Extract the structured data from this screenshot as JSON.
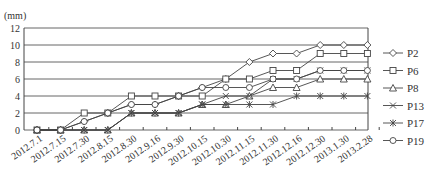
{
  "chart_data": {
    "type": "line",
    "title": "",
    "unit_label": "(mm)",
    "xlabel": "",
    "ylabel": "(mm)",
    "ylim": [
      0,
      12
    ],
    "yticks": [
      0,
      2,
      4,
      6,
      8,
      10,
      12
    ],
    "grid": true,
    "legend_position": "right",
    "categories": [
      "2012.7.1",
      "2012.7.15",
      "2012.7.30",
      "2012.8.15",
      "2012.8.30",
      "2012.9.16",
      "2012.9.30",
      "2012.10.15",
      "2012.10.30",
      "2012.11.15",
      "2012.11.30",
      "2012.12.16",
      "2012.12.30",
      "2013.1.30",
      "2013.2.28"
    ],
    "series": [
      {
        "name": "P2",
        "marker": "diamond",
        "values": [
          0,
          0,
          1,
          2,
          3,
          3,
          4,
          5,
          6,
          8,
          9,
          9,
          10,
          10,
          10
        ]
      },
      {
        "name": "P6",
        "marker": "square",
        "values": [
          0,
          0,
          2,
          2,
          4,
          4,
          4,
          4,
          6,
          6,
          7,
          7,
          9,
          9,
          9
        ]
      },
      {
        "name": "P8",
        "marker": "triangle",
        "values": [
          0,
          0,
          0,
          0,
          2,
          2,
          2,
          3,
          3,
          4,
          5,
          5,
          6,
          6,
          6
        ]
      },
      {
        "name": "P13",
        "marker": "x",
        "values": [
          0,
          0,
          0,
          0,
          2,
          2,
          2,
          3,
          4,
          4,
          6,
          6,
          7,
          7,
          7
        ]
      },
      {
        "name": "P17",
        "marker": "asterisk",
        "values": [
          0,
          0,
          0,
          0,
          2,
          2,
          2,
          3,
          3,
          3,
          3,
          4,
          4,
          4,
          4
        ]
      },
      {
        "name": "P19",
        "marker": "circle",
        "values": [
          0,
          0,
          1,
          2,
          3,
          3,
          4,
          5,
          5,
          5,
          6,
          6,
          7,
          7,
          7
        ]
      }
    ]
  },
  "legend": {
    "items": [
      {
        "label": "P2",
        "marker": "diamond-icon"
      },
      {
        "label": "P6",
        "marker": "square-icon"
      },
      {
        "label": "P8",
        "marker": "triangle-icon"
      },
      {
        "label": "P13",
        "marker": "x-icon"
      },
      {
        "label": "P17",
        "marker": "asterisk-icon"
      },
      {
        "label": "P19",
        "marker": "circle-icon"
      }
    ]
  },
  "colors": {
    "line": "#444444",
    "grid": "#555555",
    "text": "#333333",
    "background": "#ffffff"
  }
}
